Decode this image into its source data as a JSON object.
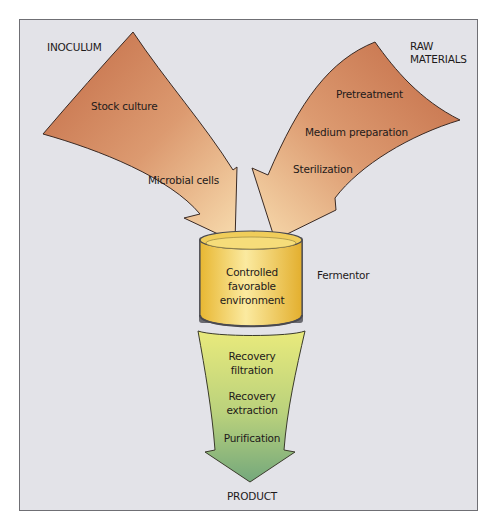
{
  "diagram": {
    "type": "process-flow",
    "colors": {
      "background": "#e3e3e8",
      "frame_border": "#6f6f74",
      "input_arrow_dark": "#c8734d",
      "input_arrow_light": "#f6d6a6",
      "fermentor_fill": "#f2c94a",
      "fermentor_highlight": "#fbeaa0",
      "output_arrow_top": "#e8e77a",
      "output_arrow_bottom": "#7fb07e",
      "outline": "#3a2a24"
    },
    "inputs": {
      "inoculum": {
        "heading": "INOCULUM",
        "steps": [
          "Stock culture",
          "Microbial cells"
        ]
      },
      "raw_materials": {
        "heading_line1": "RAW",
        "heading_line2": "MATERIALS",
        "steps": [
          "Pretreatment",
          "Medium preparation",
          "Sterilization"
        ]
      }
    },
    "fermentor": {
      "label": "Fermentor",
      "content_line1": "Controlled",
      "content_line2": "favorable",
      "content_line3": "environment"
    },
    "output": {
      "steps": [
        {
          "line1": "Recovery",
          "line2": "filtration"
        },
        {
          "line1": "Recovery",
          "line2": "extraction"
        },
        {
          "line1": "Purification"
        }
      ],
      "result": "PRODUCT"
    }
  }
}
